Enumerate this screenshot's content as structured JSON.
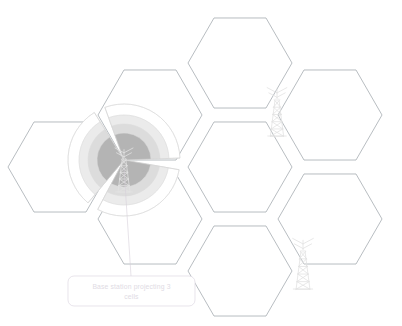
{
  "diagram": {
    "background_color": "#ffffff",
    "canvas": {
      "width": 402,
      "height": 326
    }
  },
  "colors": {
    "hex_stroke": "#9aa0a6",
    "hex_fill": "#ffffff",
    "lobe_core": "#b4b4b4",
    "lobe_inner": "#dcdcdc",
    "lobe_mid": "#ebebeb",
    "lobe_outer": "#ffffff",
    "lobe_stroke": "#d8d8d8",
    "tower_stroke": "#e2e2e2",
    "callout_stroke": "#ded8e2",
    "callout_text": "#e0dbe4",
    "leader_line": "#d6d0da"
  },
  "hex_grid": {
    "orientation": "flat-top",
    "count": 7,
    "radius": 52,
    "cells": [
      {
        "name": "cell-top-center",
        "cx": 240,
        "cy": 63
      },
      {
        "name": "cell-top-right",
        "cx": 330,
        "cy": 115
      },
      {
        "name": "cell-upper-left",
        "cx": 150,
        "cy": 115
      },
      {
        "name": "cell-center",
        "cx": 240,
        "cy": 167
      },
      {
        "name": "cell-left",
        "cx": 60,
        "cy": 167
      },
      {
        "name": "cell-lower-left",
        "cx": 150,
        "cy": 219
      },
      {
        "name": "cell-bottom-right",
        "cx": 330,
        "cy": 219
      },
      {
        "name": "cell-bottom-center",
        "cx": 240,
        "cy": 271
      }
    ]
  },
  "base_station": {
    "name": "base-station-sectors",
    "center_x": 124,
    "center_y": 160,
    "sector_count": 3,
    "sector_span_degrees": 108,
    "gap_degrees": 12,
    "sector_start_angles": [
      10,
      130,
      250
    ],
    "rings": [
      {
        "label": "core",
        "radius": 27,
        "fill": "#b4b4b4"
      },
      {
        "label": "inner",
        "radius": 36,
        "fill": "#dcdcdc"
      },
      {
        "label": "mid",
        "radius": 45,
        "fill": "#ebebeb"
      },
      {
        "label": "outer",
        "radius": 56,
        "fill": "#ffffff"
      }
    ]
  },
  "towers": [
    {
      "name": "antenna-tower-upper-right",
      "x": 277,
      "y": 92,
      "height": 44
    },
    {
      "name": "antenna-tower-lower-right",
      "x": 303,
      "y": 243,
      "height": 46
    },
    {
      "name": "antenna-tower-center",
      "x": 124,
      "y": 152,
      "height": 40
    }
  ],
  "callout": {
    "name": "base-station-callout",
    "label_line_1": "Base station projecting 3",
    "label_line_2": "cells",
    "full_label": "Base station projecting 3 cells",
    "box": {
      "x": 68,
      "y": 276,
      "width": 127,
      "height": 30,
      "radius": 6
    },
    "leader_from": {
      "x": 124,
      "y": 168
    },
    "leader_to": {
      "x": 131,
      "y": 276
    }
  }
}
